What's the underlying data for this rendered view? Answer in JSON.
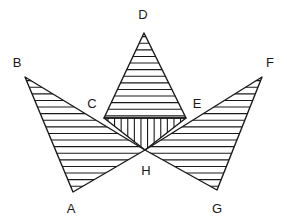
{
  "figure": {
    "canvas": {
      "width": 287,
      "height": 223,
      "background": "#ffffff"
    },
    "stroke_color": "#1a1a1a",
    "outline_width": 1.4,
    "hatch_color": "#1a1a1a",
    "hatch_width": 1.1,
    "hatch_spacing": 6.6,
    "points": {
      "A": {
        "x": 73,
        "y": 192
      },
      "B": {
        "x": 25,
        "y": 77
      },
      "C": {
        "x": 104,
        "y": 118
      },
      "D": {
        "x": 144,
        "y": 33
      },
      "E": {
        "x": 186,
        "y": 118
      },
      "F": {
        "x": 262,
        "y": 77
      },
      "G": {
        "x": 217,
        "y": 190
      },
      "H": {
        "x": 145,
        "y": 150
      }
    },
    "regions": [
      {
        "name": "left-wing",
        "vertices": "B,A,H",
        "hatch": "horizontal"
      },
      {
        "name": "right-wing",
        "vertices": "F,G,H",
        "hatch": "horizontal"
      },
      {
        "name": "top-triangle",
        "vertices": "D,C,E",
        "hatch": "horizontal"
      },
      {
        "name": "center-triangle",
        "vertices": "C,E,H",
        "hatch": "vertical"
      }
    ],
    "labels": [
      {
        "id": "A",
        "text": "A",
        "x": 71,
        "y": 208
      },
      {
        "id": "B",
        "text": "B",
        "x": 17,
        "y": 62
      },
      {
        "id": "C",
        "text": "C",
        "x": 92,
        "y": 103
      },
      {
        "id": "D",
        "text": "D",
        "x": 143,
        "y": 14
      },
      {
        "id": "E",
        "text": "E",
        "x": 197,
        "y": 103
      },
      {
        "id": "F",
        "text": "F",
        "x": 270,
        "y": 62
      },
      {
        "id": "G",
        "text": "G",
        "x": 217,
        "y": 208
      },
      {
        "id": "H",
        "text": "H",
        "x": 146,
        "y": 170
      }
    ]
  }
}
